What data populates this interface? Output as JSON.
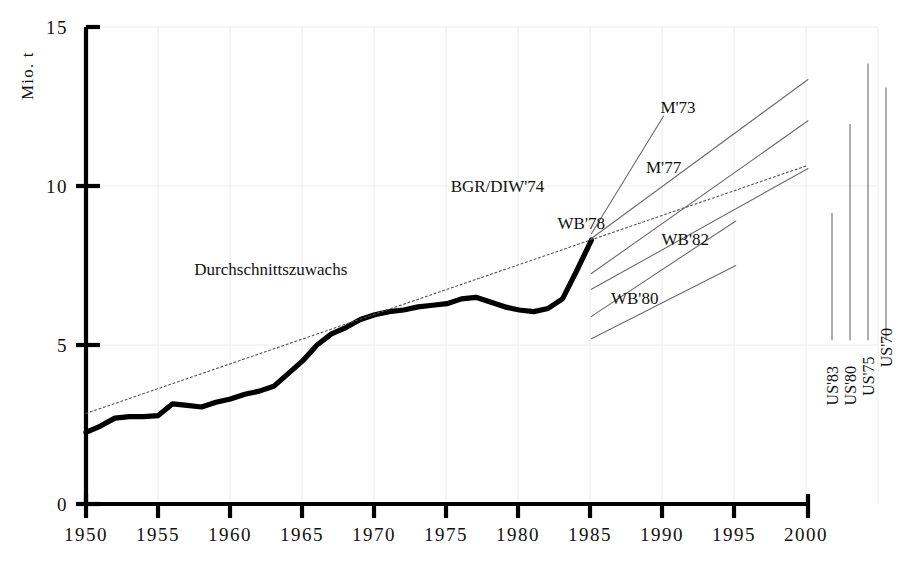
{
  "chart_data": {
    "type": "line",
    "title": "",
    "xlabel": "",
    "ylabel": "Mio. t",
    "xlim": [
      1950,
      2000
    ],
    "ylim": [
      0,
      15
    ],
    "xticks": [
      1950,
      1955,
      1960,
      1965,
      1970,
      1975,
      1980,
      1985,
      1990,
      1995,
      2000
    ],
    "yticks": [
      0,
      5,
      10,
      15
    ],
    "grid": true,
    "legend_position": "inline-annotations",
    "series": [
      {
        "name": "historical",
        "style": "solid-thick",
        "x": [
          1950,
          1951,
          1952,
          1953,
          1954,
          1955,
          1956,
          1957,
          1958,
          1959,
          1960,
          1961,
          1962,
          1963,
          1964,
          1965,
          1966,
          1967,
          1968,
          1969,
          1970,
          1971,
          1972,
          1973,
          1974,
          1975,
          1976,
          1977,
          1978,
          1979,
          1980,
          1981,
          1982,
          1983,
          1984,
          1985
        ],
        "values": [
          2.25,
          2.45,
          2.7,
          2.75,
          2.75,
          2.78,
          3.15,
          3.1,
          3.05,
          3.2,
          3.3,
          3.45,
          3.55,
          3.7,
          4.1,
          4.5,
          5.0,
          5.35,
          5.55,
          5.8,
          5.95,
          6.05,
          6.1,
          6.2,
          6.25,
          6.3,
          6.45,
          6.5,
          6.35,
          6.2,
          6.1,
          6.05,
          6.15,
          6.45,
          7.35,
          8.3
        ]
      },
      {
        "name": "Durchschnittszuwachs",
        "style": "dotted",
        "x": [
          1950,
          2000
        ],
        "values": [
          2.85,
          10.65
        ]
      },
      {
        "name": "BGR/DIW'74",
        "style": "thin",
        "x": [
          1985,
          1990
        ],
        "values": [
          8.5,
          12.2
        ]
      },
      {
        "name": "M'73",
        "style": "thin",
        "x": [
          1985,
          2000
        ],
        "values": [
          8.35,
          13.35
        ]
      },
      {
        "name": "M'77",
        "style": "thin",
        "x": [
          1985,
          2000
        ],
        "values": [
          7.25,
          12.05
        ]
      },
      {
        "name": "WB'78",
        "style": "thin",
        "x": [
          1985,
          2000
        ],
        "values": [
          6.75,
          10.55
        ]
      },
      {
        "name": "WB'82",
        "style": "thin",
        "x": [
          1985,
          1995
        ],
        "values": [
          5.9,
          8.9
        ]
      },
      {
        "name": "WB'80",
        "style": "thin",
        "x": [
          1985,
          1995
        ],
        "values": [
          5.2,
          7.5
        ]
      },
      {
        "name": "US'83",
        "style": "vertical-range",
        "x": [
          2000
        ],
        "range": [
          5.15,
          9.15
        ]
      },
      {
        "name": "US'80",
        "style": "vertical-range",
        "x": [
          2000
        ],
        "range": [
          5.15,
          11.95
        ]
      },
      {
        "name": "US'75",
        "style": "vertical-range",
        "x": [
          2000
        ],
        "range": [
          5.15,
          13.85
        ]
      },
      {
        "name": "US'70",
        "style": "vertical-range",
        "x": [
          2000
        ],
        "range": [
          5.15,
          13.1
        ]
      }
    ],
    "annotations": [
      {
        "text": "Durchschnittszuwachs",
        "x": 1962.8,
        "y": 7.2
      },
      {
        "text": "BGR/DIW'74",
        "x": 1978.5,
        "y": 9.8
      },
      {
        "text": "M'73",
        "x": 1991.0,
        "y": 12.3
      },
      {
        "text": "M'77",
        "x": 1990.0,
        "y": 10.4
      },
      {
        "text": "WB'78",
        "x": 1984.3,
        "y": 8.65
      },
      {
        "text": "WB'82",
        "x": 1991.5,
        "y": 8.15
      },
      {
        "text": "WB'80",
        "x": 1988.0,
        "y": 6.3
      },
      {
        "text": "US'83",
        "x": 2000.8,
        "y": 3.1
      },
      {
        "text": "US'80",
        "x": 2001.9,
        "y": 3.1
      },
      {
        "text": "US'75",
        "x": 2003.0,
        "y": 3.4
      },
      {
        "text": "US'70",
        "x": 2004.2,
        "y": 4.3
      }
    ]
  },
  "axis": {
    "y_title": "Mio.  t",
    "y_tick_labels": [
      "15",
      "10",
      "5",
      "0"
    ],
    "x_tick_labels": [
      "1950",
      "1955",
      "1960",
      "1965",
      "1970",
      "1975",
      "1980",
      "1985",
      "1990",
      "1995",
      "2000"
    ]
  },
  "labels": {
    "durchschnittszuwachs": "Durchschnittszuwachs",
    "bgr_diw_74": "BGR/DIW'74",
    "m73": "M'73",
    "m77": "M'77",
    "wb78": "WB'78",
    "wb82": "WB'82",
    "wb80": "WB'80",
    "us83": "US'83",
    "us80": "US'80",
    "us75": "US'75",
    "us70": "US'70"
  },
  "colors": {
    "axis": "#000000",
    "series": "#000000",
    "grid": "#e9e9ea",
    "thin_line": "#6b6b6b",
    "dotted": "#555555"
  }
}
